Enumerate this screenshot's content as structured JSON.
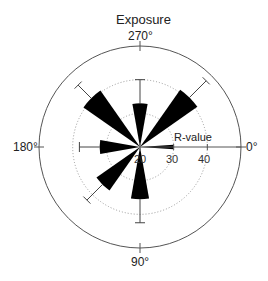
{
  "chart_data": {
    "type": "polar-bar",
    "title": "Exposure",
    "angular_axis": {
      "direction": "clockwise",
      "zero": "right",
      "tick_labels": [
        {
          "angle": 0,
          "label": "0°"
        },
        {
          "angle": 90,
          "label": "90°"
        },
        {
          "angle": 180,
          "label": "180°"
        },
        {
          "angle": 270,
          "label": "270°"
        }
      ]
    },
    "radial_axis": {
      "label": "R-value",
      "range": [
        20,
        50
      ],
      "ticks": [
        20,
        30,
        40
      ],
      "gridlines": [
        30,
        40
      ],
      "grid_style": "dotted"
    },
    "series": [
      {
        "angle": 0,
        "value": 30,
        "error": 0,
        "width_deg": 8
      },
      {
        "angle": 90,
        "value": 35.5,
        "error": 7,
        "width_deg": 20
      },
      {
        "angle": 135,
        "value": 35.8,
        "error": 6.5,
        "width_deg": 20
      },
      {
        "angle": 180,
        "value": 32,
        "error": 6,
        "width_deg": 20
      },
      {
        "angle": 225,
        "value": 40.5,
        "error": 5.5,
        "width_deg": 20
      },
      {
        "angle": 270,
        "value": 33,
        "error": 7,
        "width_deg": 20
      },
      {
        "angle": 315,
        "value": 40.8,
        "error": 7,
        "width_deg": 20
      }
    ],
    "colors": {
      "bar": "#000000",
      "axis": "#555555",
      "grid": "#999999"
    }
  },
  "labels": {
    "title": "Exposure",
    "angle_0": "0°",
    "angle_90": "90°",
    "angle_180": "180°",
    "angle_270": "270°",
    "radial_axis_label": "R-value",
    "tick_20": "20",
    "tick_30": "30",
    "tick_40": "40"
  }
}
